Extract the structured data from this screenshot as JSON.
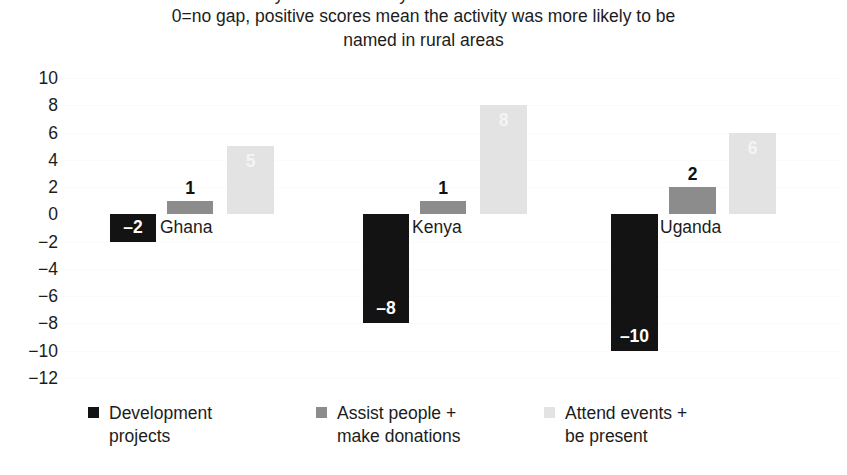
{
  "chart_data": {
    "type": "bar",
    "title": "0=no gap, positive scores mean the activity was more likely to be",
    "title_line2": "named in rural areas",
    "title_clipped_line": "activity was more likely to be named in rural areas",
    "subtitle": "",
    "xlabel": "",
    "ylabel": "",
    "ylim": [
      -12,
      10
    ],
    "ytick_step": 2,
    "grid": true,
    "legend_position": "bottom",
    "categories": [
      "Ghana",
      "Kenya",
      "Uganda"
    ],
    "ytick_labels": [
      "10",
      "8",
      "6",
      "4",
      "2",
      "0",
      "−2",
      "−4",
      "−6",
      "−8",
      "−10",
      "−12"
    ],
    "ytick_values": [
      10,
      8,
      6,
      4,
      2,
      0,
      -2,
      -4,
      -6,
      -8,
      -10,
      -12
    ],
    "series": [
      {
        "name": "Development projects",
        "name_line1": "Development",
        "name_line2": "projects",
        "color": "#131313",
        "values": [
          -2,
          -8,
          -10
        ],
        "labels": [
          "–2",
          "–8",
          "–10"
        ]
      },
      {
        "name": "Assist people + make donations",
        "name_line1": "Assist people +",
        "name_line2": "make donations",
        "color": "#8c8c8c",
        "values": [
          1,
          1,
          2
        ],
        "labels": [
          "1",
          "1",
          "2"
        ]
      },
      {
        "name": "Attend events + be present",
        "name_line1": "Attend events +",
        "name_line2": "be present",
        "color": "#e3e3e3",
        "values": [
          5,
          8,
          6
        ],
        "labels": [
          "5",
          "8",
          "6"
        ]
      }
    ]
  },
  "axis": {
    "y_ticks": [
      {
        "label": "10"
      },
      {
        "label": "8"
      },
      {
        "label": "6"
      },
      {
        "label": "4"
      },
      {
        "label": "2"
      },
      {
        "label": "0"
      },
      {
        "label": "−2"
      },
      {
        "label": "−4"
      },
      {
        "label": "−6"
      },
      {
        "label": "−8"
      },
      {
        "label": "−10"
      },
      {
        "label": "−12"
      }
    ]
  },
  "bars": [
    {
      "cat": "Ghana",
      "series": 0,
      "value": -2,
      "label": "–2",
      "x": 48,
      "w": 46,
      "label_pos": "inside"
    },
    {
      "cat": "Ghana",
      "series": 1,
      "value": 1,
      "label": "1",
      "x": 105,
      "w": 46,
      "label_pos": "outside"
    },
    {
      "cat": "Ghana",
      "series": 2,
      "value": 5,
      "label": "5",
      "x": 165,
      "w": 47,
      "label_pos": "faint"
    },
    {
      "cat": "Kenya",
      "series": 0,
      "value": -8,
      "label": "–8",
      "x": 301,
      "w": 46,
      "label_pos": "inside"
    },
    {
      "cat": "Kenya",
      "series": 1,
      "value": 1,
      "label": "1",
      "x": 358,
      "w": 46,
      "label_pos": "outside"
    },
    {
      "cat": "Kenya",
      "series": 2,
      "value": 8,
      "label": "8",
      "x": 418,
      "w": 47,
      "label_pos": "faint"
    },
    {
      "cat": "Uganda",
      "series": 0,
      "value": -10,
      "label": "–10",
      "x": 549,
      "w": 47,
      "label_pos": "inside"
    },
    {
      "cat": "Uganda",
      "series": 1,
      "value": 2,
      "label": "2",
      "x": 607,
      "w": 47,
      "label_pos": "outside"
    },
    {
      "cat": "Uganda",
      "series": 2,
      "value": 6,
      "label": "6",
      "x": 667,
      "w": 47,
      "label_pos": "faint"
    }
  ],
  "category_labels": [
    {
      "text": "Ghana",
      "x": 98
    },
    {
      "text": "Kenya",
      "x": 350
    },
    {
      "text": "Uganda",
      "x": 598
    }
  ],
  "legend": {
    "items": [
      {
        "line1": "Development",
        "line2": "projects",
        "swatch": "s0",
        "x": 88
      },
      {
        "line1": "Assist people +",
        "line2": "make donations",
        "swatch": "s1",
        "x": 316
      },
      {
        "line1": "Attend events +",
        "line2": "be present",
        "swatch": "s2",
        "x": 544
      }
    ]
  }
}
